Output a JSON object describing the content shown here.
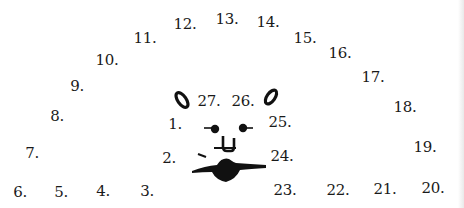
{
  "worksheet": {
    "type": "connect-the-dots",
    "ink_color": "#111111",
    "background_color": "#ffffff"
  },
  "dots": [
    {
      "label": "1.",
      "x": 175,
      "y": 124
    },
    {
      "label": "2.",
      "x": 169,
      "y": 158
    },
    {
      "label": "3.",
      "x": 147,
      "y": 191
    },
    {
      "label": "4.",
      "x": 103,
      "y": 191
    },
    {
      "label": "5.",
      "x": 61,
      "y": 192
    },
    {
      "label": "6.",
      "x": 20,
      "y": 192
    },
    {
      "label": "7.",
      "x": 32,
      "y": 153
    },
    {
      "label": "8.",
      "x": 57,
      "y": 116
    },
    {
      "label": "9.",
      "x": 77,
      "y": 86
    },
    {
      "label": "10.",
      "x": 107,
      "y": 60
    },
    {
      "label": "11.",
      "x": 145,
      "y": 38
    },
    {
      "label": "12.",
      "x": 185,
      "y": 24
    },
    {
      "label": "13.",
      "x": 227,
      "y": 19
    },
    {
      "label": "14.",
      "x": 268,
      "y": 22
    },
    {
      "label": "15.",
      "x": 305,
      "y": 38
    },
    {
      "label": "16.",
      "x": 340,
      "y": 53
    },
    {
      "label": "17.",
      "x": 373,
      "y": 77
    },
    {
      "label": "18.",
      "x": 405,
      "y": 107
    },
    {
      "label": "19.",
      "x": 425,
      "y": 147
    },
    {
      "label": "20.",
      "x": 433,
      "y": 188
    },
    {
      "label": "21.",
      "x": 385,
      "y": 189
    },
    {
      "label": "22.",
      "x": 338,
      "y": 190
    },
    {
      "label": "23.",
      "x": 285,
      "y": 190
    },
    {
      "label": "24.",
      "x": 282,
      "y": 156
    },
    {
      "label": "25.",
      "x": 280,
      "y": 122
    },
    {
      "label": "26.",
      "x": 243,
      "y": 101
    },
    {
      "label": "27.",
      "x": 209,
      "y": 101
    }
  ],
  "face_features": [
    "left-ear-oval",
    "right-ear-oval",
    "left-eye",
    "right-eye",
    "nose",
    "whisker",
    "mouth"
  ]
}
